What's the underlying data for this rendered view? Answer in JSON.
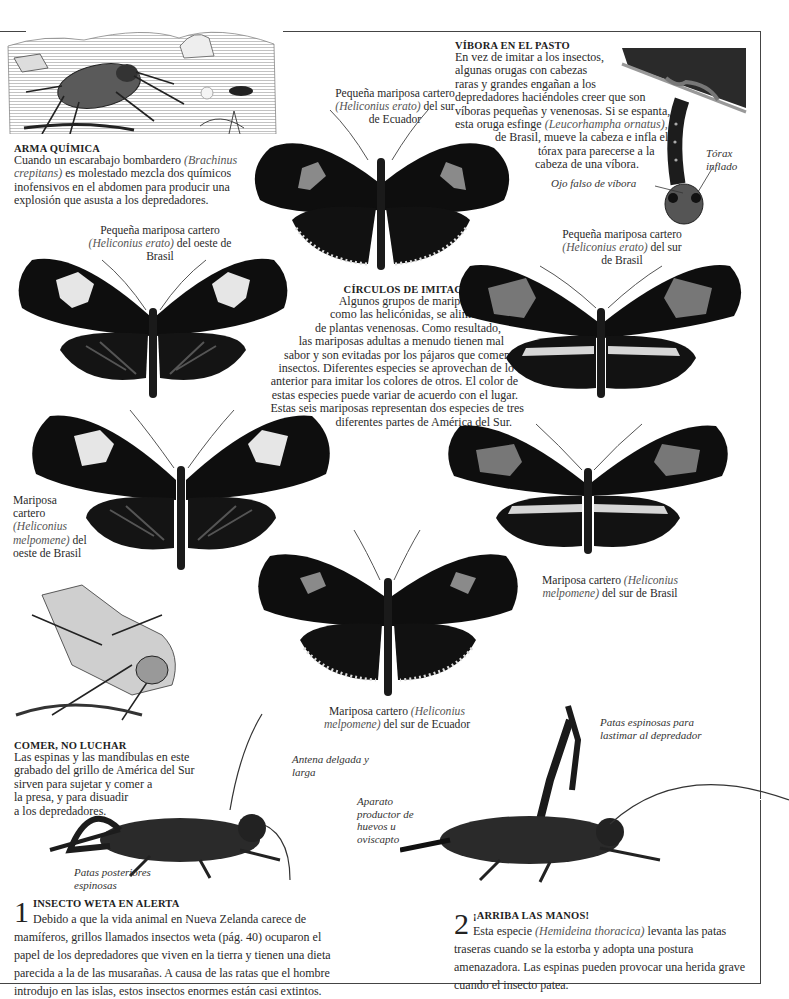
{
  "colors": {
    "ink": "#0e0e0e",
    "wing_gray": "#7c7c7c",
    "pale": "#d8d8d8",
    "text": "#2a2a2a",
    "caption_italic": "#555555"
  },
  "arma_quimica": {
    "title": "ARMA QUÍMICA",
    "text_1": "Cuando un escarabajo bombardero ",
    "species": "(Brachinus crepitans)",
    "text_2": " es molestado mezcla dos químicos inofensivos en el abdomen para producir una explosión que asusta a los depredadores."
  },
  "vibora": {
    "title": "VÍBORA EN EL PASTO",
    "lines": [
      "En vez de imitar a los insectos,",
      "algunas orugas con cabezas",
      "raras y grandes engañan a los",
      "depredadores haciéndoles creer que son",
      "víboras pequeñas y venenosas. Si se espanta,"
    ],
    "line6_a": "esta oruga esfinge ",
    "line6_species": "(Leucorhampha ornatus),",
    "line7": "de Brasil, mueve la cabeza e infla el",
    "line8": "tórax para parecerse a la",
    "line9": "cabeza de una víbora.",
    "label_torax": "Tórax inflado",
    "label_ojo": "Ojo falso de víbora"
  },
  "circulos": {
    "title": "CÍRCULOS DE IMITACIÓN",
    "lines": [
      "Algunos grupos de mariposas,",
      "como las helicónidas, se alimentan",
      "de plantas venenosas. Como resultado,",
      "las mariposas adultas a menudo tienen mal",
      "sabor y son evitadas por los pájaros que comen",
      "insectos. Diferentes especies se aprovechan de lo",
      "anterior para imitar los colores de otros. El color de",
      "estas especies puede variar de acuerdo con el lugar.",
      "Estas seis mariposas representan dos especies de tres",
      "diferentes partes de América del Sur."
    ]
  },
  "butterflies": [
    {
      "id": "erato-ecuador",
      "pre": "Pequeña mariposa cartero ",
      "species": "(Heliconius erato)",
      "post": " del sur de Ecuador"
    },
    {
      "id": "erato-oeste-brasil",
      "pre": "Pequeña mariposa cartero ",
      "species": "(Heliconius erato)",
      "post": " del oeste de Brasil"
    },
    {
      "id": "erato-sur-brasil",
      "pre": "Pequeña mariposa cartero ",
      "species": "(Heliconius erato)",
      "post": " del sur de Brasil"
    },
    {
      "id": "melpomene-oeste-brasil",
      "pre": "Mariposa cartero ",
      "species": "(Heliconius melpomene)",
      "post": " del oeste de Brasil"
    },
    {
      "id": "melpomene-sur-brasil",
      "pre": "Mariposa cartero ",
      "species": "(Heliconius melpomene)",
      "post": " del sur de Brasil"
    },
    {
      "id": "melpomene-ecuador",
      "pre": "Mariposa cartero ",
      "species": "(Heliconius melpomene)",
      "post": " del sur de Ecuador"
    }
  ],
  "comer": {
    "title": "COMER, NO LUCHAR",
    "lines": [
      "Las espinas y las mandíbulas en este",
      "grabado del grillo de América del Sur",
      "sirven para sujetar y comer a",
      "la presa, y para disuadir",
      "a los depredadores."
    ]
  },
  "weta_labels": {
    "antena": "Antena delgada y larga",
    "patas_posteriores": "Patas posteriores espinosas",
    "aparato": "Aparato productor de huevos u oviscapto",
    "patas_espinosas": "Patas espinosas para lastimar al depredador"
  },
  "section_1": {
    "number": "1",
    "title": "INSECTO WETA EN ALERTA",
    "text": "Debido a que la vida animal en Nueva Zelanda carece de mamíferos, grillos llamados insectos weta (pág. 40) ocuparon el papel de los depredadores que viven en la tierra y tienen una dieta parecida a la de las musarañas. A causa de las ratas que el hombre introdujo en las islas, estos insectos enormes están casi extintos."
  },
  "section_2": {
    "number": "2",
    "title": "¡ARRIBA LAS MANOS!",
    "text_1": "Esta especie ",
    "species": "(Hemideina thoracica)",
    "text_2": " levanta las patas traseras cuando se la estorba y adopta una postura amenazadora. Las espinas pueden provocar una herida grave cuando el insecto patea."
  }
}
